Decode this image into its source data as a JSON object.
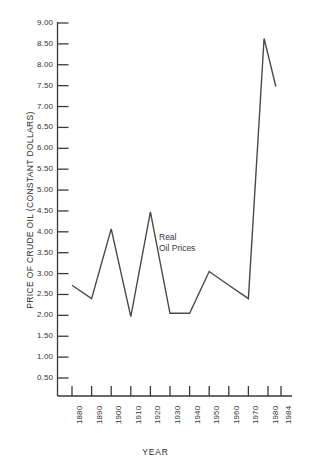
{
  "chart_data": {
    "type": "line",
    "title": "",
    "xlabel": "YEAR",
    "ylabel": "PRICE OF CRUDE OIL (CONSTANT DOLLARS)",
    "grid": false,
    "legend_position": "inline-annotation",
    "annotations": [
      {
        "text_line1": "Real",
        "text_line2": "Oil Prices",
        "x": 1925,
        "y": 4.1
      }
    ],
    "xlim": [
      1880,
      1984
    ],
    "ylim": [
      0.2,
      9.0
    ],
    "yticks": [
      "0.50",
      "1.00",
      "1.50",
      "2.00",
      "2.50",
      "3.00",
      "3.50",
      "4.00",
      "4.50",
      "5.00",
      "5.50",
      "6.00",
      "6.50",
      "7.00",
      "7.50",
      "8.00",
      "8.50",
      "9.00"
    ],
    "ytick_values": [
      0.5,
      1.0,
      1.5,
      2.0,
      2.5,
      3.0,
      3.5,
      4.0,
      4.5,
      5.0,
      5.5,
      6.0,
      6.5,
      7.0,
      7.5,
      8.0,
      8.5,
      9.0
    ],
    "xticks": [
      "1880",
      "1890",
      "1900",
      "1910",
      "1920",
      "1930",
      "1940",
      "1950",
      "1960",
      "1970",
      "1980",
      "1984"
    ],
    "xtick_values": [
      1880,
      1890,
      1900,
      1910,
      1920,
      1930,
      1940,
      1950,
      1960,
      1970,
      1980,
      1984
    ],
    "series": [
      {
        "name": "Real Oil Prices",
        "color": "#4a4a4a",
        "x": [
          1880,
          1890,
          1900,
          1910,
          1920,
          1930,
          1940,
          1950,
          1960,
          1970,
          1978,
          1984
        ],
        "values": [
          2.72,
          2.4,
          4.07,
          1.97,
          4.48,
          2.05,
          2.05,
          3.05,
          2.72,
          2.4,
          8.63,
          7.48
        ]
      }
    ]
  },
  "axis": {
    "ylabel": "PRICE OF CRUDE OIL (CONSTANT DOLLARS)",
    "xlabel": "YEAR"
  },
  "annotation": {
    "line1": "Real",
    "line2": "Oil Prices"
  },
  "colors": {
    "series": "#4a4a4a",
    "axis": "#3a3a3a",
    "text": "#2b2b2b",
    "background": "#ffffff"
  }
}
